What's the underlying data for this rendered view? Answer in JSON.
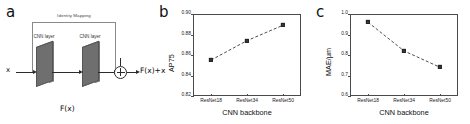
{
  "figure": {
    "panels": [
      {
        "letter": "a",
        "type": "diagram",
        "title": "Residual block with identity mapping",
        "labels": {
          "identity_mapping": "Identity Mapping",
          "cnn_layer_1": "CNN layer",
          "cnn_layer_2": "CNN layer",
          "input": "x",
          "output": "F(x)+x",
          "residual": "F(x)",
          "sum_node_icon": "circle-plus-icon"
        }
      },
      {
        "letter": "b",
        "type": "chart"
      },
      {
        "letter": "c",
        "type": "chart"
      }
    ]
  },
  "chart_data": [
    {
      "panel": "b",
      "type": "line",
      "title": "",
      "xlabel": "CNN backbone",
      "ylabel": "AP75",
      "categories": [
        "ResNet18",
        "ResNet34",
        "ResNet50"
      ],
      "values": [
        0.855,
        0.874,
        0.889
      ],
      "ylim": [
        0.82,
        0.9
      ],
      "yticks": [
        "0.82",
        "0.84",
        "0.86",
        "0.88",
        "0.90"
      ],
      "ytick_values": [
        0.82,
        0.84,
        0.86,
        0.88,
        0.9
      ],
      "grid": false,
      "legend": "none",
      "marker": "square",
      "linestyle": "dashed",
      "color": "#3a3a3a"
    },
    {
      "panel": "c",
      "type": "line",
      "title": "",
      "xlabel": "CNN backbone",
      "ylabel": "MAE/μm",
      "categories": [
        "ResNet18",
        "ResNet34",
        "ResNet50"
      ],
      "values": [
        0.96,
        0.82,
        0.74
      ],
      "ylim": [
        0.6,
        1.0
      ],
      "yticks": [
        "0.6",
        "0.7",
        "0.8",
        "0.9",
        "1.0"
      ],
      "ytick_values": [
        0.6,
        0.7,
        0.8,
        0.9,
        1.0
      ],
      "grid": false,
      "legend": "none",
      "marker": "square",
      "linestyle": "dashed",
      "color": "#3a3a3a"
    }
  ]
}
